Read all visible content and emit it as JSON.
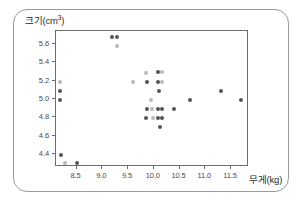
{
  "chart_data": {
    "type": "scatter",
    "title": "",
    "xlabel": "무게(kg)",
    "ylabel": "크기(cm",
    "ylabel_exponent": "3",
    "ylabel_close": ")",
    "xlim": [
      8.1,
      11.85
    ],
    "ylim": [
      4.26,
      5.74
    ],
    "xticks": [
      "8.5",
      "9.0",
      "9.5",
      "10.0",
      "10.5",
      "11.0",
      "11.5"
    ],
    "xtick_values": [
      8.5,
      9.0,
      9.5,
      10.0,
      10.5,
      11.0,
      11.5
    ],
    "yticks": [
      "5.6",
      "5.4",
      "5.2",
      "5.0",
      "4.8",
      "4.6",
      "4.4"
    ],
    "ytick_values": [
      5.6,
      5.4,
      5.2,
      5.0,
      4.8,
      4.6,
      4.4
    ],
    "grid": false,
    "legend": null,
    "marker": "circle",
    "colors": {
      "dark": "#555555",
      "mid": "#8e8e8e",
      "light": "#b9b9b9",
      "frame": "#6d6d6d",
      "text": "#2b2b2b",
      "card_border": "#9a9a9a"
    },
    "points": [
      {
        "x": 9.19,
        "y": 5.68,
        "shade": "dark"
      },
      {
        "x": 9.28,
        "y": 5.68,
        "shade": "dark"
      },
      {
        "x": 9.28,
        "y": 5.58,
        "shade": "light"
      },
      {
        "x": 8.18,
        "y": 5.19,
        "shade": "light"
      },
      {
        "x": 8.18,
        "y": 5.09,
        "shade": "dark"
      },
      {
        "x": 8.18,
        "y": 4.99,
        "shade": "dark"
      },
      {
        "x": 8.19,
        "y": 4.39,
        "shade": "dark"
      },
      {
        "x": 8.27,
        "y": 4.3,
        "shade": "light"
      },
      {
        "x": 8.5,
        "y": 4.3,
        "shade": "dark"
      },
      {
        "x": 9.6,
        "y": 5.19,
        "shade": "light"
      },
      {
        "x": 9.84,
        "y": 5.28,
        "shade": "light"
      },
      {
        "x": 9.86,
        "y": 5.19,
        "shade": "dark"
      },
      {
        "x": 9.86,
        "y": 4.89,
        "shade": "dark"
      },
      {
        "x": 9.84,
        "y": 4.79,
        "shade": "dark"
      },
      {
        "x": 9.95,
        "y": 4.99,
        "shade": "light"
      },
      {
        "x": 9.97,
        "y": 4.89,
        "shade": "light"
      },
      {
        "x": 9.98,
        "y": 4.79,
        "shade": "light"
      },
      {
        "x": 10.08,
        "y": 5.29,
        "shade": "dark"
      },
      {
        "x": 10.15,
        "y": 5.29,
        "shade": "light"
      },
      {
        "x": 10.08,
        "y": 5.19,
        "shade": "dark"
      },
      {
        "x": 10.16,
        "y": 5.19,
        "shade": "light"
      },
      {
        "x": 10.11,
        "y": 5.09,
        "shade": "dark"
      },
      {
        "x": 10.08,
        "y": 4.89,
        "shade": "dark"
      },
      {
        "x": 10.16,
        "y": 4.89,
        "shade": "dark"
      },
      {
        "x": 10.08,
        "y": 4.79,
        "shade": "dark"
      },
      {
        "x": 10.16,
        "y": 4.79,
        "shade": "dark"
      },
      {
        "x": 10.13,
        "y": 4.69,
        "shade": "dark"
      },
      {
        "x": 10.4,
        "y": 4.89,
        "shade": "dark"
      },
      {
        "x": 10.7,
        "y": 4.99,
        "shade": "dark"
      },
      {
        "x": 11.3,
        "y": 5.09,
        "shade": "dark"
      },
      {
        "x": 11.7,
        "y": 4.99,
        "shade": "dark"
      }
    ]
  }
}
